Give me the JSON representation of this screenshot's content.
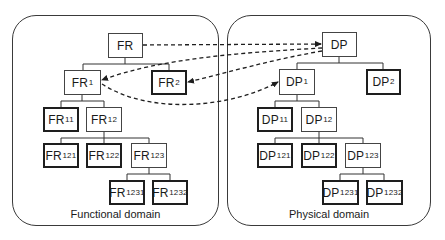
{
  "domains": {
    "functional": {
      "label": "Functional domain",
      "nodes": {
        "FR": {
          "base": "FR",
          "sub": ""
        },
        "FR1": {
          "base": "FR",
          "sub": "1"
        },
        "FR2": {
          "base": "FR",
          "sub": "2"
        },
        "FR11": {
          "base": "FR",
          "sub": "11"
        },
        "FR12": {
          "base": "FR",
          "sub": "12"
        },
        "FR121": {
          "base": "FR",
          "sub": "121"
        },
        "FR122": {
          "base": "FR",
          "sub": "122"
        },
        "FR123": {
          "base": "FR",
          "sub": "123"
        },
        "FR1231": {
          "base": "FR",
          "sub": "1231"
        },
        "FR1232": {
          "base": "FR",
          "sub": "1232"
        }
      }
    },
    "physical": {
      "label": "Physical domain",
      "nodes": {
        "DP": {
          "base": "DP",
          "sub": ""
        },
        "DP1": {
          "base": "DP",
          "sub": "1"
        },
        "DP2": {
          "base": "DP",
          "sub": "2"
        },
        "DP11": {
          "base": "DP",
          "sub": "11"
        },
        "DP12": {
          "base": "DP",
          "sub": "12"
        },
        "DP121": {
          "base": "DP",
          "sub": "121"
        },
        "DP122": {
          "base": "DP",
          "sub": "122"
        },
        "DP123": {
          "base": "DP",
          "sub": "123"
        },
        "DP1231": {
          "base": "DP",
          "sub": "1231"
        },
        "DP1232": {
          "base": "DP",
          "sub": "1232"
        }
      }
    }
  },
  "mappings": [
    {
      "from": "FR",
      "to": "DP",
      "style": "dashed"
    },
    {
      "from": "DP",
      "to": "FR1",
      "style": "dashed"
    },
    {
      "from": "DP",
      "to": "FR2",
      "style": "dashed"
    },
    {
      "from": "FR1",
      "to": "DP1",
      "style": "dashed"
    }
  ],
  "hierarchy": {
    "FR": [
      "FR1",
      "FR2"
    ],
    "FR1": [
      "FR11",
      "FR12"
    ],
    "FR12": [
      "FR121",
      "FR122",
      "FR123"
    ],
    "FR123": [
      "FR1231",
      "FR1232"
    ],
    "DP": [
      "DP1",
      "DP2"
    ],
    "DP1": [
      "DP11",
      "DP12"
    ],
    "DP12": [
      "DP121",
      "DP122",
      "DP123"
    ],
    "DP123": [
      "DP1231",
      "DP1232"
    ]
  }
}
